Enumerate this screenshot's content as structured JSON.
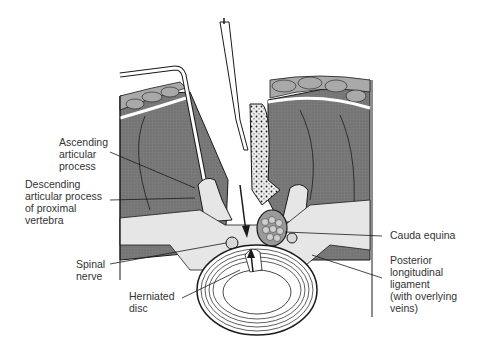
{
  "diagram": {
    "type": "anatomical-cross-section",
    "colors": {
      "muscle": "#7a7a7a",
      "fat": "#a9a9a9",
      "bone_light": "#e6e6e6",
      "outline": "#1a1a1a",
      "background": "#ffffff",
      "label_text": "#333333"
    },
    "labels": [
      {
        "id": "ascending-articular-process",
        "text": "Ascending\narticular\nprocess"
      },
      {
        "id": "descending-articular-process",
        "text": "Descending\narticular process\nof proximal\nvertebra"
      },
      {
        "id": "spinal-nerve",
        "text": "Spinal\nnerve"
      },
      {
        "id": "herniated-disc",
        "text": "Herniated\ndisc"
      },
      {
        "id": "cauda-equina",
        "text": "Cauda equina"
      },
      {
        "id": "posterior-longitudinal-ligament",
        "text": "Posterior\nlongitudinal\nligament\n(with overlying\nveins)"
      }
    ]
  }
}
